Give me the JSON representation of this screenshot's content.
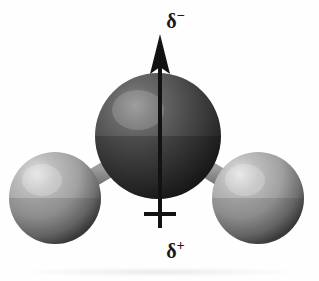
{
  "figure": {
    "background_color": "#fefefe",
    "width": 319,
    "height": 281
  },
  "labels": {
    "negative_symbol": "δ",
    "negative_sign": "−",
    "positive_symbol": "δ",
    "positive_sign": "+",
    "negative_full": "δ−",
    "positive_full": "δ+"
  },
  "dipole_arrow": {
    "name": "dipole-moment-vector",
    "direction": "up",
    "color": "#121212",
    "shaft_x": 160,
    "head_tip_y": 36,
    "head_base_y": 72,
    "head_half_width": 9,
    "shaft_width": 4,
    "shaft_bottom_y": 228,
    "crossbar_y": 214,
    "crossbar_half_width": 16,
    "crossbar_thickness": 4
  },
  "atoms": [
    {
      "name": "oxygen-atom",
      "element": "O",
      "role": "central",
      "cx": 158,
      "cy": 136,
      "r": 63,
      "base_color": "#4a4a4a",
      "highlight_color": "#8c8c8c",
      "shadow_color": "#1e1e1e",
      "highlight_x": "32%",
      "highlight_y": "26%"
    },
    {
      "name": "hydrogen-atom-left",
      "element": "H",
      "role": "terminal",
      "cx": 55,
      "cy": 198,
      "r": 46,
      "base_color": "#a3a3a3",
      "highlight_color": "#e2e2e2",
      "shadow_color": "#3d3d3d",
      "highlight_x": "30%",
      "highlight_y": "24%"
    },
    {
      "name": "hydrogen-atom-right",
      "element": "H",
      "role": "terminal",
      "cx": 258,
      "cy": 198,
      "r": 46,
      "base_color": "#a3a3a3",
      "highlight_color": "#e2e2e2",
      "shadow_color": "#3d3d3d",
      "highlight_x": "30%",
      "highlight_y": "24%"
    }
  ],
  "bonds": [
    {
      "name": "bond-oxygen-hydrogen-left",
      "from": "oxygen-atom",
      "to": "hydrogen-atom-left",
      "color": "#9a9a9a",
      "edge_color": "#5a5a5a",
      "thickness": 17
    },
    {
      "name": "bond-oxygen-hydrogen-right",
      "from": "oxygen-atom",
      "to": "hydrogen-atom-right",
      "color": "#9a9a9a",
      "edge_color": "#5a5a5a",
      "thickness": 17
    }
  ],
  "ground_shadow": {
    "name": "ground-shadow",
    "color": "#f0f0f0",
    "y": 272
  }
}
